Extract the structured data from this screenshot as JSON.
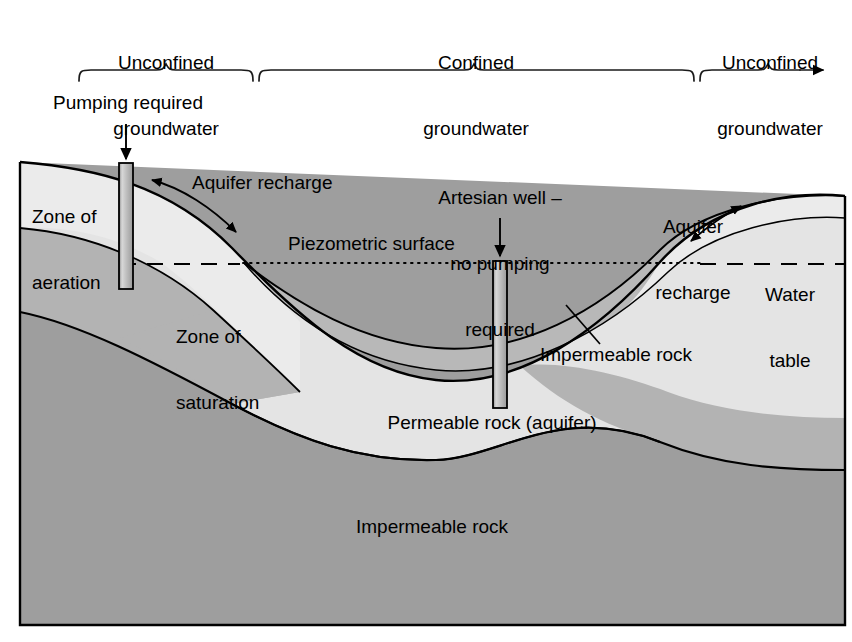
{
  "figure": {
    "colors": {
      "background": "#ffffff",
      "outline": "#000000",
      "zone_of_aeration": "#ebebeb",
      "zone_of_saturation": "#b3b3b3",
      "impermeable_rock_base": "#9e9e9e",
      "confining_layer": "#b8b8b8",
      "permeable_rock_aquifer": "#e4e4e4",
      "well_casing": "#c9c9c9"
    }
  },
  "top_scale": {
    "segments": [
      {
        "label_line1": "Unconfined",
        "label_line2": "groundwater"
      },
      {
        "label_line1": "Confined",
        "label_line2": "groundwater"
      },
      {
        "label_line1": "Unconfined",
        "label_line2": "groundwater"
      }
    ]
  },
  "callouts": {
    "pumping_required": "Pumping required",
    "artesian_well_line1": "Artesian well –",
    "artesian_well_line2": "no pumping",
    "artesian_well_line3": "required",
    "aquifer_recharge_left": "Aquifer recharge",
    "aquifer_recharge_right_line1": "Aquifer",
    "aquifer_recharge_right_line2": "recharge",
    "piezometric_surface": "Piezometric surface",
    "water_table_line1": "Water",
    "water_table_line2": "table"
  },
  "layers": {
    "zone_of_aeration_line1": "Zone of",
    "zone_of_aeration_line2": "aeration",
    "zone_of_saturation_line1": "Zone of",
    "zone_of_saturation_line2": "saturation",
    "confining_rock": "Impermeable rock",
    "permeable_rock": "Permeable rock (aquifer)",
    "basement_rock": "Impermeable rock"
  }
}
